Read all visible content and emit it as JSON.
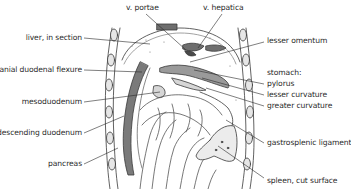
{
  "diagram": {
    "type": "anatomical-illustration",
    "colors": {
      "line": "#3a3a3a",
      "dark_fill": "#6e6e6e",
      "mid_fill": "#9a9a9a",
      "light_fill": "#d6d6d6",
      "background": "#ffffff",
      "text": "#2a2a2a"
    },
    "labels": {
      "top": [
        {
          "id": "v-portae",
          "text": "v. portae"
        },
        {
          "id": "v-hepatica",
          "text": "v. hepatica"
        }
      ],
      "left": [
        {
          "id": "liver-in-section",
          "text": "liver, in section"
        },
        {
          "id": "cranial-duodenal-flexure",
          "text": "cranial duodenal flexure"
        },
        {
          "id": "mesoduodenum",
          "text": "mesoduodenum"
        },
        {
          "id": "descending-duodenum",
          "text": "descending duodenum"
        },
        {
          "id": "pancreas",
          "text": "pancreas"
        }
      ],
      "right": [
        {
          "id": "lesser-omentum",
          "text": "lesser omentum"
        },
        {
          "id": "stomach",
          "text": "stomach:"
        },
        {
          "id": "pylorus",
          "text": "pylorus"
        },
        {
          "id": "lesser-curvature",
          "text": "lesser curvature"
        },
        {
          "id": "greater-curvature",
          "text": "greater curvature"
        },
        {
          "id": "gastrosplenic-ligament",
          "text": "gastrosplenic ligament"
        },
        {
          "id": "spleen-cut-surface",
          "text": "spleen, cut surface"
        }
      ]
    }
  }
}
